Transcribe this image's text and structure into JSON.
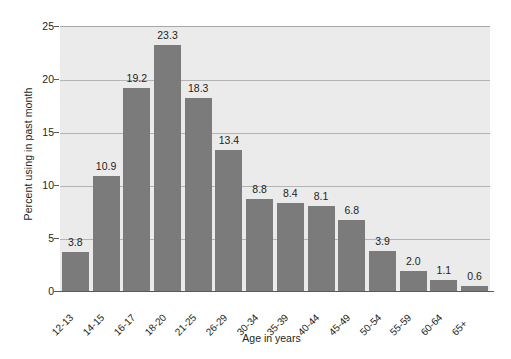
{
  "chart_data": {
    "type": "bar",
    "title": "",
    "xlabel": "Age in years",
    "ylabel": "Percent using in past month",
    "ylim": [
      0,
      25
    ],
    "yticks": [
      0,
      5,
      10,
      15,
      20,
      25
    ],
    "grid": true,
    "legend": "none",
    "bar_color": "#7b7b7b",
    "plot_background": "#ebebeb",
    "categories": [
      "12-13",
      "14-15",
      "16-17",
      "18-20",
      "21-25",
      "26-29",
      "30-34",
      "35-39",
      "40-44",
      "45-49",
      "50-54",
      "55-59",
      "60-64",
      "65+"
    ],
    "values": [
      3.8,
      10.9,
      19.2,
      23.3,
      18.3,
      13.4,
      8.8,
      8.4,
      8.1,
      6.8,
      3.9,
      2.0,
      1.1,
      0.6
    ],
    "data_labels": [
      "3.8",
      "10.9",
      "19.2",
      "23.3",
      "18.3",
      "13.4",
      "8.8",
      "8.4",
      "8.1",
      "6.8",
      "3.9",
      "2.0",
      "1.1",
      "0.6"
    ]
  },
  "axes": {
    "y_tick_labels": [
      "0",
      "5",
      "10",
      "15",
      "20",
      "25"
    ],
    "y_title": "Percent using in past month",
    "x_title": "Age in years"
  }
}
